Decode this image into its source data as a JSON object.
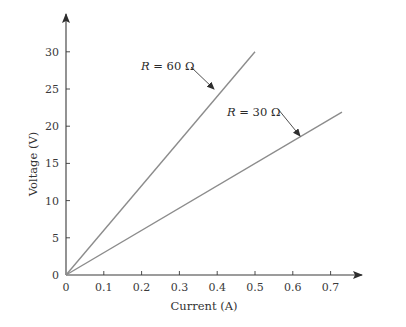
{
  "chart_data": {
    "type": "line",
    "title": "",
    "xlabel": "Current (A)",
    "ylabel": "Voltage (V)",
    "xlim": [
      0,
      0.75
    ],
    "ylim": [
      0,
      33
    ],
    "x_ticks": [
      "0",
      "0.1",
      "0.2",
      "0.3",
      "0.4",
      "0.5",
      "0.6",
      "0.7"
    ],
    "y_ticks": [
      "0",
      "5",
      "10",
      "15",
      "20",
      "25",
      "30"
    ],
    "grid": false,
    "legend": "none (inline annotations)",
    "series": [
      {
        "name": "R = 60 Ω",
        "resistance_ohm": 60,
        "x": [
          0,
          0.5
        ],
        "y": [
          0,
          30
        ],
        "color": "#8c8c8c"
      },
      {
        "name": "R = 30 Ω",
        "resistance_ohm": 30,
        "x": [
          0,
          0.73
        ],
        "y": [
          0,
          21.9
        ],
        "color": "#8c8c8c"
      }
    ],
    "annotations": [
      {
        "text_italic": "R",
        "text_rest": " = 60 Ω",
        "points_to_series": "R = 60 Ω"
      },
      {
        "text_italic": "R",
        "text_rest": " = 30 Ω",
        "points_to_series": "R = 30 Ω"
      }
    ]
  },
  "colors": {
    "axis": "#3a3a3a",
    "series_line": "#8c8c8c",
    "text": "#333333"
  }
}
